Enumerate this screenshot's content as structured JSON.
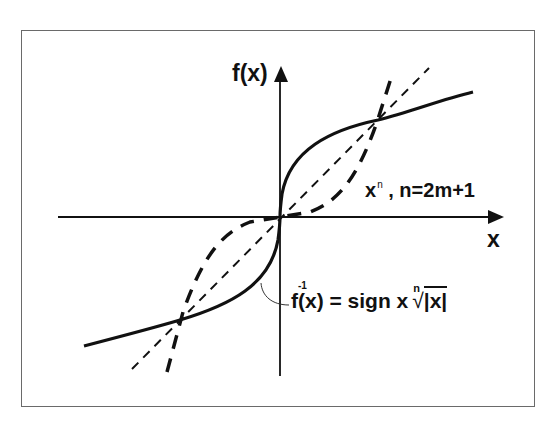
{
  "diagram": {
    "type": "function-graph",
    "axes": {
      "y_label": "f(x)",
      "x_label": "x"
    },
    "curves": [
      {
        "name": "power-function",
        "style": "long-dash",
        "label": "xⁿ , n=2m+1",
        "label_base": "x",
        "label_sup": "n",
        "label_rest": " , n=2m+1"
      },
      {
        "name": "inverse-function",
        "style": "solid-thick",
        "label": "f⁻¹(x) = sign x ⁿ√|x|",
        "label_f": "f",
        "label_sup": "-1",
        "label_arg": "(x) = sign x",
        "root_index": "n",
        "root_radical": "√",
        "root_argument": "|x|"
      },
      {
        "name": "identity-line",
        "style": "short-dash",
        "label": "y = x"
      }
    ],
    "colors": {
      "stroke": "#111111",
      "frame": "#6a6a6a",
      "background": "#ffffff"
    }
  }
}
